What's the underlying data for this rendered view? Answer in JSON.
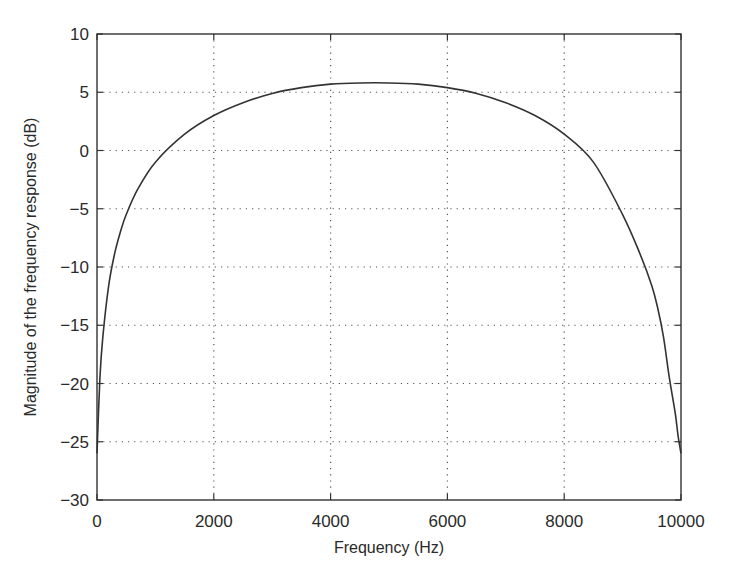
{
  "chart_data": {
    "type": "line",
    "title": "",
    "xlabel": "Frequency (Hz)",
    "ylabel": "Magnitude of the frequency response (dB)",
    "xlim": [
      0,
      10000
    ],
    "ylim": [
      -30,
      10
    ],
    "xticks": [
      0,
      2000,
      4000,
      6000,
      8000,
      10000
    ],
    "yticks": [
      10,
      5,
      0,
      -5,
      -10,
      -15,
      -20,
      -25,
      -30
    ],
    "grid": true,
    "grid_style": "dotted",
    "legend": null,
    "series": [
      {
        "name": "magnitude",
        "color": "#333333",
        "x": [
          0,
          50,
          100,
          200,
          300,
          400,
          500,
          700,
          1000,
          1500,
          2000,
          2500,
          3000,
          3500,
          4000,
          4500,
          5000,
          5500,
          6000,
          6500,
          7000,
          7500,
          8000,
          8500,
          9000,
          9300,
          9500,
          9600,
          9700,
          9800,
          9900,
          9950,
          10000
        ],
        "y": [
          -26,
          -19.5,
          -16,
          -11.6,
          -8.9,
          -7.0,
          -5.5,
          -3.3,
          -1.0,
          1.4,
          3.0,
          4.1,
          4.9,
          5.4,
          5.7,
          5.8,
          5.8,
          5.7,
          5.4,
          4.9,
          4.1,
          3.0,
          1.4,
          -1.0,
          -5.5,
          -8.9,
          -11.6,
          -13.5,
          -16,
          -19.5,
          -22.5,
          -24.5,
          -26
        ]
      }
    ]
  }
}
